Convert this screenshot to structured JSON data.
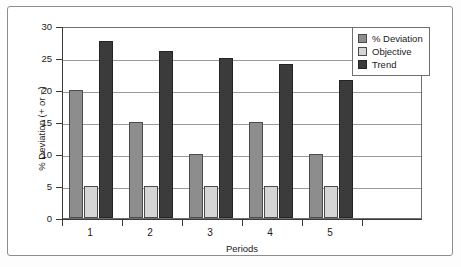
{
  "chart_data": {
    "type": "bar",
    "title": "",
    "xlabel": "Periods",
    "ylabel": "% Deviation (+ or −)",
    "categories": [
      "1",
      "2",
      "3",
      "4",
      "5"
    ],
    "series": [
      {
        "name": "% Deviation",
        "color": "#8d8d8d",
        "values": [
          20,
          15,
          10,
          15,
          10
        ]
      },
      {
        "name": "Objective",
        "color": "#d5d5d5",
        "values": [
          5,
          5,
          5,
          5,
          5
        ]
      },
      {
        "name": "Trend",
        "color": "#3b3b3b",
        "values": [
          27.7,
          26.1,
          25.0,
          24.0,
          21.6
        ]
      }
    ],
    "ylim": [
      0,
      30
    ],
    "yticks": [
      0,
      5,
      10,
      15,
      20,
      25,
      30
    ],
    "ytick_labels": [
      "0",
      "5",
      "10",
      "15",
      "20",
      "25",
      "30"
    ],
    "grid": true,
    "grid_axis": "y",
    "legend_position": "upper right",
    "legend_entries": [
      "% Deviation",
      "Objective",
      "Trend"
    ]
  }
}
